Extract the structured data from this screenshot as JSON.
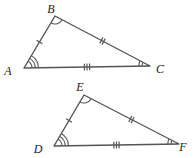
{
  "figure": {
    "background_color": "#ffffff",
    "stroke_color": "#555555",
    "label_color": "#222222",
    "triangles": [
      {
        "id": "triangle-abc",
        "name": "Triangle ABC",
        "vertices": [
          {
            "id": "A",
            "label": "A",
            "x": 24,
            "y": 68,
            "label_x": 8,
            "label_y": 72,
            "angle_arcs": 3
          },
          {
            "id": "B",
            "label": "B",
            "x": 55,
            "y": 16,
            "label_x": 51,
            "label_y": 10,
            "angle_arcs": 1
          },
          {
            "id": "C",
            "label": "C",
            "x": 150,
            "y": 66,
            "label_x": 160,
            "label_y": 70,
            "angle_arcs": 2
          }
        ],
        "sides": [
          {
            "id": "AB",
            "from": "A",
            "to": "B",
            "ticks": 1
          },
          {
            "id": "BC",
            "from": "B",
            "to": "C",
            "ticks": 2
          },
          {
            "id": "AC",
            "from": "A",
            "to": "C",
            "ticks": 3
          }
        ]
      },
      {
        "id": "triangle-def",
        "name": "Triangle DEF",
        "vertices": [
          {
            "id": "D",
            "label": "D",
            "x": 54,
            "y": 146,
            "label_x": 38,
            "label_y": 150,
            "angle_arcs": 3
          },
          {
            "id": "E",
            "label": "E",
            "x": 84,
            "y": 95,
            "label_x": 80,
            "label_y": 88,
            "angle_arcs": 1
          },
          {
            "id": "F",
            "label": "F",
            "x": 179,
            "y": 144,
            "label_x": 183,
            "label_y": 148,
            "angle_arcs": 2
          }
        ],
        "sides": [
          {
            "id": "DE",
            "from": "D",
            "to": "E",
            "ticks": 1
          },
          {
            "id": "EF",
            "from": "E",
            "to": "F",
            "ticks": 2
          },
          {
            "id": "DF",
            "from": "D",
            "to": "F",
            "ticks": 3
          }
        ]
      }
    ]
  }
}
